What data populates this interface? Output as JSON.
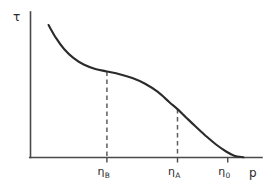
{
  "chart_data": {
    "type": "line",
    "title": "",
    "subtitle": "",
    "xlabel": "p",
    "ylabel": "τ",
    "grid": false,
    "legend": null,
    "axes": {
      "x_axis_label": "p",
      "y_axis_label": "τ",
      "x_tick_labels": [
        "η_B",
        "η_A",
        "η_0"
      ],
      "y_tick_labels": [],
      "xlim": [
        0,
        1
      ],
      "ylim": [
        0,
        1
      ],
      "arrowheads": false
    },
    "ticks": [
      {
        "id": "eta-b",
        "base": "η",
        "subscript": "B",
        "x_norm": 0.33
      },
      {
        "id": "eta-a",
        "base": "η",
        "subscript": "A",
        "x_norm": 0.635
      },
      {
        "id": "eta-0",
        "base": "η",
        "subscript": "0",
        "x_norm": 0.852
      }
    ],
    "series": [
      {
        "name": "shear-stress-vs-pressure",
        "x": [
          0.078,
          0.11,
          0.145,
          0.185,
          0.232,
          0.28,
          0.33,
          0.385,
          0.44,
          0.495,
          0.55,
          0.6,
          0.635,
          0.672,
          0.712,
          0.755,
          0.8,
          0.845,
          0.88,
          0.92
        ],
        "y": [
          0.955,
          0.862,
          0.782,
          0.718,
          0.668,
          0.638,
          0.62,
          0.6,
          0.572,
          0.531,
          0.472,
          0.398,
          0.348,
          0.288,
          0.224,
          0.158,
          0.094,
          0.042,
          0.012,
          0.0
        ]
      }
    ],
    "annotations": [
      {
        "type": "dashed-dropline",
        "from_tick": "eta-b",
        "x_norm": 0.33,
        "y_top_norm": 0.62,
        "y_bottom_norm": 0.0
      },
      {
        "type": "dashed-dropline",
        "from_tick": "eta-a",
        "x_norm": 0.635,
        "y_top_norm": 0.348,
        "y_bottom_norm": 0.0
      }
    ],
    "colors": {
      "background": "#ffffff",
      "curve": "#2b2b2b",
      "axis": "#4a4a4a",
      "dashed_guide": "#5d5d5d",
      "text": "#2b2b2b"
    }
  },
  "labels": {
    "y_axis": "τ",
    "x_axis": "p",
    "eta_b_base": "η",
    "eta_b_sub": "B",
    "eta_a_base": "η",
    "eta_a_sub": "A",
    "eta_0_base": "η",
    "eta_0_sub": "0"
  }
}
